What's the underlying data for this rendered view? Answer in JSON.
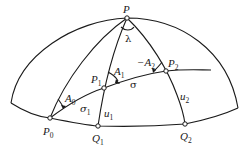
{
  "diagram": {
    "type": "spherical-geodesic",
    "stroke_color": "#1a1a1a",
    "background": "#ffffff",
    "points": {
      "P": {
        "name": "P",
        "sub": ""
      },
      "P0": {
        "name": "P",
        "sub": "0"
      },
      "P1": {
        "name": "P",
        "sub": "1"
      },
      "P2": {
        "name": "P",
        "sub": "2"
      },
      "Q1": {
        "name": "Q",
        "sub": "1"
      },
      "Q2": {
        "name": "Q",
        "sub": "2"
      }
    },
    "angles": {
      "lambda": "λ",
      "A0": {
        "name": "A",
        "sub": "0"
      },
      "A1": {
        "name": "A",
        "sub": "1"
      },
      "A2": {
        "prefix": "−",
        "name": "A",
        "sub": "2"
      }
    },
    "arcs": {
      "sigma": "σ",
      "sigma1": {
        "name": "σ",
        "sub": "1"
      },
      "u1": {
        "name": "u",
        "sub": "1"
      },
      "u2": {
        "name": "u",
        "sub": "2"
      }
    }
  }
}
